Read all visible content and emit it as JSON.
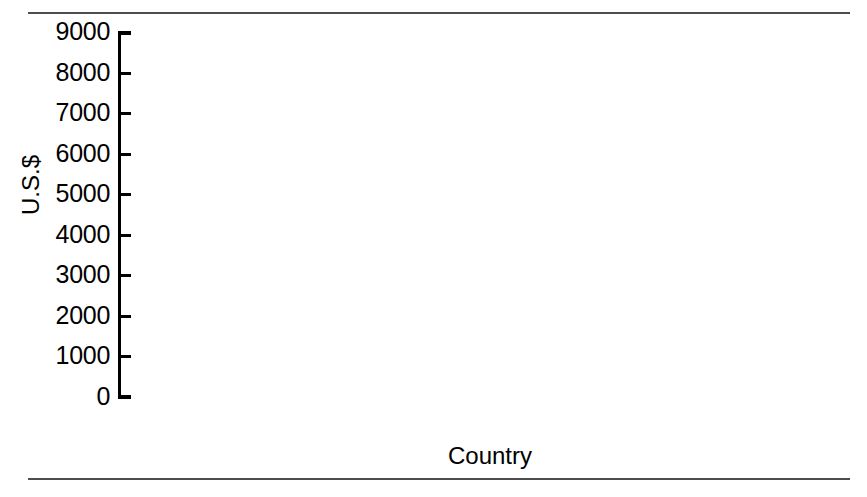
{
  "chart_data": {
    "type": "bar",
    "title": "",
    "subtitle": "",
    "xlabel": "Country",
    "ylabel": "U.S.$",
    "categories": [
      "Argentina",
      "Uruguay",
      "Chile",
      "Brazil",
      "Mexico",
      "Venezuela",
      "Peru"
    ],
    "values": [
      8380,
      5481,
      4860,
      4410,
      3690,
      3020,
      2420
    ],
    "value_labels": [
      "8,380",
      "5,481",
      "4,860",
      "4,410",
      "3,690",
      "3,020",
      "2,420"
    ],
    "ylim": [
      0,
      9000
    ],
    "ytick_values": [
      0,
      1000,
      2000,
      3000,
      4000,
      5000,
      6000,
      7000,
      8000,
      9000
    ],
    "ytick_labels": [
      "0",
      "1000",
      "2000",
      "3000",
      "4000",
      "5000",
      "6000",
      "7000",
      "8000",
      "9000"
    ],
    "grid": false,
    "legend": false,
    "legend_position": "none",
    "orientation": "vertical",
    "colors": {
      "bar_face": "#d9d9d9",
      "bar_shadow": "#3f3f3f",
      "axis": "#000000",
      "text": "#000000",
      "background": "#ffffff",
      "rule": "#4d4d4d"
    }
  },
  "figure": {
    "top_rule": "",
    "bottom_rule": ""
  }
}
